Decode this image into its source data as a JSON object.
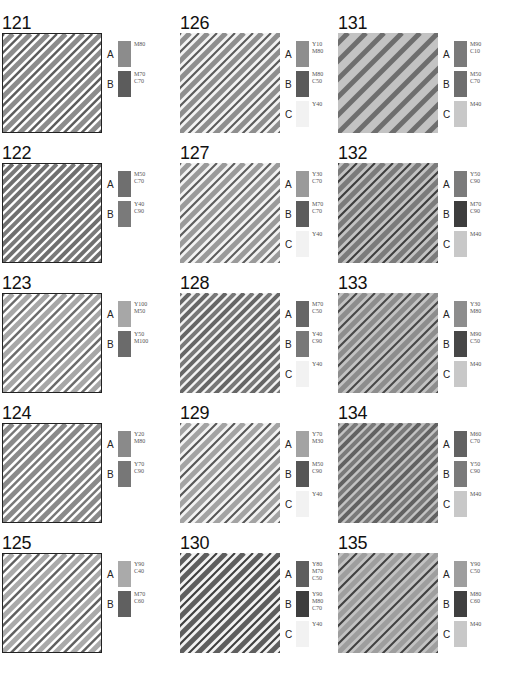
{
  "cells": [
    {
      "id": "121",
      "swatches": [
        {
          "label": "A",
          "code": "M80",
          "color": "#8c8c8c"
        },
        {
          "label": "B",
          "code": "M70\nC70",
          "color": "#5c5c5c"
        }
      ],
      "bg": "#ffffff",
      "stripes": [
        {
          "color": "#8c8c8c",
          "w": 5
        },
        {
          "color": "#5c5c5c",
          "w": 2.5
        }
      ],
      "bordered": true
    },
    {
      "id": "122",
      "swatches": [
        {
          "label": "A",
          "code": "M50\nC70",
          "color": "#6f6f6f"
        },
        {
          "label": "B",
          "code": "Y40\nC90",
          "color": "#7a7a7a"
        }
      ],
      "bg": "#ffffff",
      "stripes": [
        {
          "color": "#6f6f6f",
          "w": 4
        },
        {
          "color": "#7a7a7a",
          "w": 4
        }
      ],
      "bordered": true
    },
    {
      "id": "123",
      "swatches": [
        {
          "label": "A",
          "code": "Y100\nM50",
          "color": "#a7a7a7"
        },
        {
          "label": "B",
          "code": "Y50\nM100",
          "color": "#6b6b6b"
        }
      ],
      "bg": "#ffffff",
      "stripes": [
        {
          "color": "#a7a7a7",
          "w": 5
        },
        {
          "color": "#6b6b6b",
          "w": 2.5
        }
      ],
      "bordered": true
    },
    {
      "id": "124",
      "swatches": [
        {
          "label": "A",
          "code": "Y20\nM80",
          "color": "#8a8a8a"
        },
        {
          "label": "B",
          "code": "Y70\nC90",
          "color": "#777777"
        }
      ],
      "bg": "#ffffff",
      "stripes": [
        {
          "color": "#8a8a8a",
          "w": 5
        },
        {
          "color": "#777777",
          "w": 2.5
        }
      ],
      "bordered": true
    },
    {
      "id": "125",
      "swatches": [
        {
          "label": "A",
          "code": "Y90\nC40",
          "color": "#aaaaaa"
        },
        {
          "label": "B",
          "code": "M70\nC60",
          "color": "#606060"
        }
      ],
      "bg": "#ffffff",
      "stripes": [
        {
          "color": "#aaaaaa",
          "w": 5
        },
        {
          "color": "#606060",
          "w": 2.5
        }
      ],
      "bordered": true
    },
    {
      "id": "126",
      "swatches": [
        {
          "label": "A",
          "code": "Y10\nM80",
          "color": "#8e8e8e"
        },
        {
          "label": "B",
          "code": "M80\nC50",
          "color": "#5a5a5a"
        },
        {
          "label": "C",
          "code": "Y40",
          "color": "#f2f2f2"
        }
      ],
      "bg": "#f3f3f3",
      "stripes": [
        {
          "color": "#8e8e8e",
          "w": 5
        },
        {
          "color": "#5a5a5a",
          "w": 2
        }
      ],
      "bordered": false
    },
    {
      "id": "127",
      "swatches": [
        {
          "label": "A",
          "code": "Y30\nC70",
          "color": "#9a9a9a"
        },
        {
          "label": "B",
          "code": "M70\nC70",
          "color": "#5c5c5c"
        },
        {
          "label": "C",
          "code": "Y40",
          "color": "#f2f2f2"
        }
      ],
      "bg": "#f3f3f3",
      "stripes": [
        {
          "color": "#9a9a9a",
          "w": 5
        },
        {
          "color": "#5c5c5c",
          "w": 2
        }
      ],
      "bordered": false
    },
    {
      "id": "128",
      "swatches": [
        {
          "label": "A",
          "code": "M70\nC50",
          "color": "#666666"
        },
        {
          "label": "B",
          "code": "Y40\nC90",
          "color": "#787878"
        },
        {
          "label": "C",
          "code": "Y40",
          "color": "#f2f2f2"
        }
      ],
      "bg": "#f3f3f3",
      "stripes": [
        {
          "color": "#666666",
          "w": 4
        },
        {
          "color": "#787878",
          "w": 4
        }
      ],
      "bordered": false
    },
    {
      "id": "129",
      "swatches": [
        {
          "label": "A",
          "code": "Y70\nM30",
          "color": "#a3a3a3"
        },
        {
          "label": "B",
          "code": "M50\nC90",
          "color": "#565656"
        },
        {
          "label": "C",
          "code": "Y40",
          "color": "#f2f2f2"
        }
      ],
      "bg": "#f3f3f3",
      "stripes": [
        {
          "color": "#a3a3a3",
          "w": 5
        },
        {
          "color": "#565656",
          "w": 2
        }
      ],
      "bordered": false
    },
    {
      "id": "130",
      "swatches": [
        {
          "label": "A",
          "code": "Y80\nM70\nC50",
          "color": "#5e5e5e"
        },
        {
          "label": "B",
          "code": "Y90\nM80\nC70",
          "color": "#3e3e3e"
        },
        {
          "label": "C",
          "code": "Y40",
          "color": "#f2f2f2"
        }
      ],
      "bg": "#f3f3f3",
      "stripes": [
        {
          "color": "#5e5e5e",
          "w": 5
        },
        {
          "color": "#3e3e3e",
          "w": 2
        }
      ],
      "bordered": false
    },
    {
      "id": "131",
      "swatches": [
        {
          "label": "A",
          "code": "M90\nC10",
          "color": "#7a7a7a"
        },
        {
          "label": "B",
          "code": "M50\nC70",
          "color": "#6e6e6e"
        },
        {
          "label": "C",
          "code": "M40",
          "color": "#c8c8c8"
        }
      ],
      "bg": "#c3c3c3",
      "stripes": [
        {
          "color": "#6e6e6e",
          "w": 5
        },
        {
          "color": "#7a7a7a",
          "w": 0
        }
      ],
      "bordered": false
    },
    {
      "id": "132",
      "swatches": [
        {
          "label": "A",
          "code": "Y50\nC90",
          "color": "#7b7b7b"
        },
        {
          "label": "B",
          "code": "M70\nC90",
          "color": "#3d3d3d"
        },
        {
          "label": "C",
          "code": "M40",
          "color": "#c8c8c8"
        }
      ],
      "bg": "#c3c3c3",
      "stripes": [
        {
          "color": "#7b7b7b",
          "w": 5
        },
        {
          "color": "#3d3d3d",
          "w": 2
        }
      ],
      "bordered": false
    },
    {
      "id": "133",
      "swatches": [
        {
          "label": "A",
          "code": "Y30\nM80",
          "color": "#8d8d8d"
        },
        {
          "label": "B",
          "code": "M90\nC50",
          "color": "#474747"
        },
        {
          "label": "C",
          "code": "M40",
          "color": "#c8c8c8"
        }
      ],
      "bg": "#c3c3c3",
      "stripes": [
        {
          "color": "#8d8d8d",
          "w": 5
        },
        {
          "color": "#474747",
          "w": 2
        }
      ],
      "bordered": false
    },
    {
      "id": "134",
      "swatches": [
        {
          "label": "A",
          "code": "M60\nC70",
          "color": "#626262"
        },
        {
          "label": "B",
          "code": "Y50\nC90",
          "color": "#7a7a7a"
        },
        {
          "label": "C",
          "code": "M40",
          "color": "#c8c8c8"
        }
      ],
      "bg": "#c3c3c3",
      "stripes": [
        {
          "color": "#626262",
          "w": 4
        },
        {
          "color": "#7a7a7a",
          "w": 4
        }
      ],
      "bordered": false
    },
    {
      "id": "135",
      "swatches": [
        {
          "label": "A",
          "code": "Y90\nC50",
          "color": "#9e9e9e"
        },
        {
          "label": "B",
          "code": "M80\nC60",
          "color": "#404040"
        },
        {
          "label": "C",
          "code": "M40",
          "color": "#c8c8c8"
        }
      ],
      "bg": "#c3c3c3",
      "stripes": [
        {
          "color": "#9e9e9e",
          "w": 5
        },
        {
          "color": "#404040",
          "w": 2
        }
      ],
      "bordered": false
    }
  ]
}
